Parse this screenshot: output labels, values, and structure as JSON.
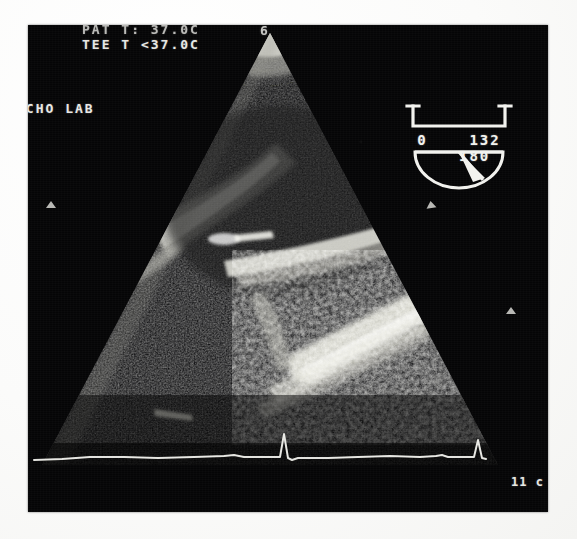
{
  "page": {
    "type": "medical-ultrasound-still-frame",
    "modality": "TEE",
    "background_color": "#fdfdfc",
    "frame_color": "#050506",
    "overlay_text_color": "#e8e8e4"
  },
  "overlay": {
    "patient_temp": "PAT T: 37.0C",
    "probe_temp": "TEE T <37.0C",
    "institution": "ECHO LAB",
    "corner_glyph": "6",
    "depth_label": "11 c"
  },
  "angle_indicator": {
    "name": "probe-rotation-angle",
    "min_label": "0",
    "current_label": "132",
    "max_label": "180",
    "numbers_line": "0  132  180",
    "current_value": 132,
    "min_value": 0,
    "max_value": 180,
    "color": "#f2f2ee"
  },
  "markers": {
    "left_tick": "depth-caliper-left",
    "right_tick": "depth-caliper-right",
    "edge_tick": "depth-caliper-edge"
  },
  "ecg": {
    "label": "ecg-trace",
    "color": "#dcdcd6",
    "beats": 2,
    "baseline_y": 36
  },
  "sector": {
    "apex_x": 242,
    "apex_y": 8,
    "left_angle_deg": -46,
    "right_angle_deg": 46,
    "radius": 430
  }
}
